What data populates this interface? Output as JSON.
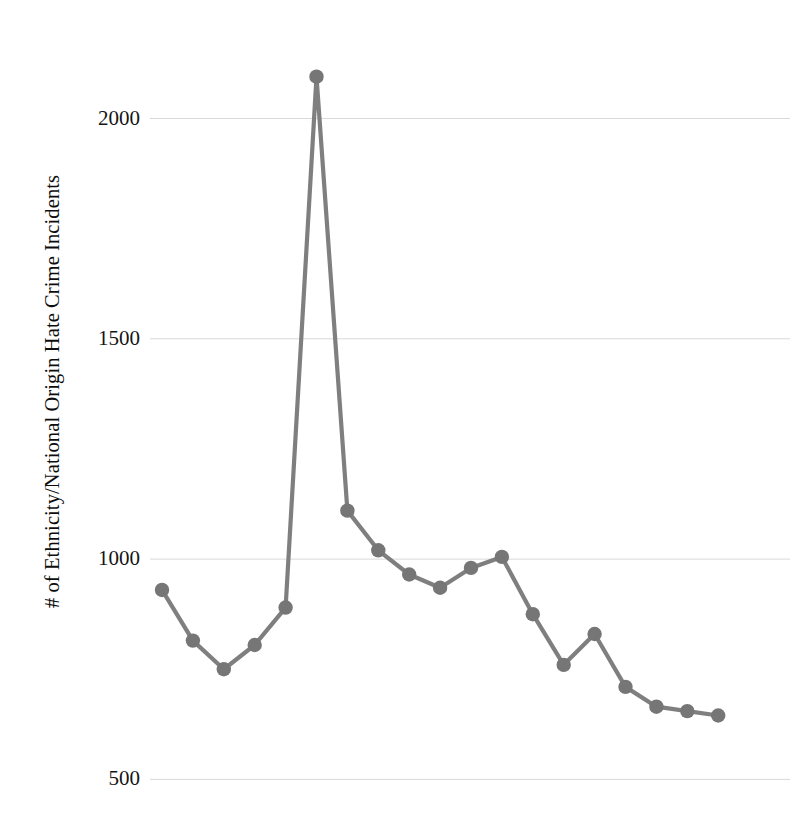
{
  "chart_data": {
    "type": "line",
    "title": "",
    "xlabel": "",
    "ylabel": "# of Ethnicity/National Origin Hate Crime Incidents",
    "ylim": [
      450,
      2150
    ],
    "y_ticks": [
      2000,
      1500,
      1000,
      500
    ],
    "y_tick_labels": [
      "2000",
      "1500",
      "1000",
      "500"
    ],
    "grid": "horizontal-only",
    "legend": "none",
    "x": [
      1,
      2,
      3,
      4,
      5,
      6,
      7,
      8,
      9,
      10,
      11,
      12,
      13,
      14,
      15,
      16,
      17,
      18,
      19
    ],
    "x_tick_labels": [],
    "series": [
      {
        "name": "Ethnicity/National Origin Hate Crime Incidents",
        "color": "#7f7f7f",
        "marker": "circle",
        "values": [
          930,
          815,
          750,
          805,
          890,
          2095,
          1110,
          1020,
          965,
          935,
          980,
          1005,
          875,
          760,
          830,
          710,
          665,
          655,
          645
        ]
      }
    ]
  },
  "axis": {
    "y_title": "# of Ethnicity/National Origin Hate Crime Incidents"
  }
}
